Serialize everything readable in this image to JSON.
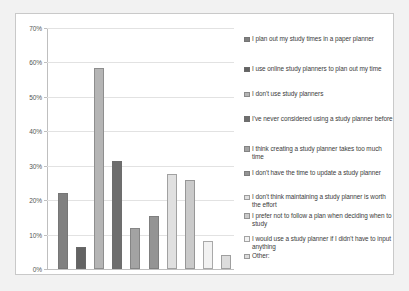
{
  "chart_data": {
    "type": "bar",
    "title": "",
    "xlabel": "",
    "ylabel": "",
    "ylim": [
      0,
      70
    ],
    "grid": true,
    "legend_position": "right",
    "ytick_labels": [
      "70%",
      "60%",
      "50%",
      "40%",
      "30%",
      "20%",
      "10%",
      "0%"
    ],
    "ytick_values": [
      70,
      60,
      50,
      40,
      30,
      20,
      10,
      0
    ],
    "categories": [
      "I plan out my study times in a paper planner",
      "I use online study planners to plan out my time",
      "I don't use study planners",
      "I've never considered using a study planner before",
      "I think creating a study planner takes too much time",
      "I don't have the time to update a study planner",
      "I don't think maintaining a study planner is worth the effort",
      "I prefer not to follow a plan when deciding when to study",
      "I would use a study planner if I didn't have to input anything",
      "Other:"
    ],
    "values": [
      22,
      6.5,
      58.5,
      31.5,
      12,
      15.5,
      27.5,
      26,
      8,
      4
    ],
    "colors": [
      "#808080",
      "#636363",
      "#b5b5b5",
      "#6e6e6e",
      "#a3a3a3",
      "#949494",
      "#e0e0e0",
      "#cacaca",
      "#f2f2f2",
      "#dcdcdc"
    ]
  },
  "legend": {
    "items": [
      {
        "label": "I plan out my study times in a paper planner"
      },
      {
        "label": "I use online study planners to plan out my time"
      },
      {
        "label": "I don't use study planners"
      },
      {
        "label": "I've never considered using a study planner before"
      },
      {
        "label": "I think creating a study planner takes too much time"
      },
      {
        "label": "I don't have the time to update a study planner"
      },
      {
        "label": "I don't think maintaining a study planner is worth the effort"
      },
      {
        "label": "I prefer not to follow a plan when deciding when to study"
      },
      {
        "label": "I would use a study planner if I didn't have to input anything"
      },
      {
        "label": "Other:"
      }
    ]
  }
}
